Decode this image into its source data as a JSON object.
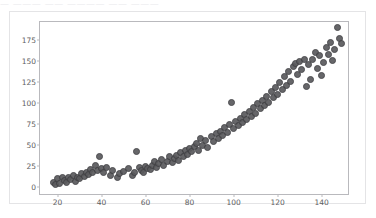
{
  "window": {
    "clipped_top_text": "—  ———  ——  ————  ——  ———"
  },
  "colors": {
    "marker_fill": "#5a5a5d",
    "marker_edge": "#3f3f42",
    "axis_line": "#b9b9bd",
    "tick_label": "#5e5e62",
    "card_border": "#e4e4e6",
    "background": "#ffffff"
  },
  "chart_data": {
    "type": "scatter",
    "title": "",
    "xlabel": "",
    "ylabel": "",
    "xlim": [
      12,
      152
    ],
    "ylim": [
      -8,
      196
    ],
    "grid": false,
    "legend": null,
    "xticks": [
      20,
      40,
      60,
      80,
      100,
      120,
      140
    ],
    "yticks": [
      0,
      25,
      50,
      75,
      100,
      125,
      150,
      175
    ],
    "xtick_labels": [
      "20",
      "40",
      "60",
      "80",
      "100",
      "120",
      "140"
    ],
    "ytick_labels": [
      "0",
      "25",
      "50",
      "75",
      "100",
      "125",
      "150",
      "175"
    ],
    "marker": "circle",
    "marker_size": 7,
    "series": [
      {
        "name": "series-1",
        "points": [
          [
            18,
            6
          ],
          [
            19,
            3
          ],
          [
            20,
            10
          ],
          [
            21,
            5
          ],
          [
            22,
            12
          ],
          [
            23,
            8
          ],
          [
            24,
            6
          ],
          [
            25,
            11
          ],
          [
            26,
            9
          ],
          [
            27,
            14
          ],
          [
            28,
            7
          ],
          [
            29,
            12
          ],
          [
            30,
            10
          ],
          [
            31,
            16
          ],
          [
            32,
            13
          ],
          [
            33,
            18
          ],
          [
            34,
            15
          ],
          [
            35,
            21
          ],
          [
            36,
            17
          ],
          [
            37,
            26
          ],
          [
            38,
            20
          ],
          [
            39,
            36
          ],
          [
            40,
            22
          ],
          [
            41,
            18
          ],
          [
            42,
            24
          ],
          [
            44,
            14
          ],
          [
            45,
            20
          ],
          [
            47,
            12
          ],
          [
            48,
            16
          ],
          [
            50,
            19
          ],
          [
            52,
            22
          ],
          [
            54,
            14
          ],
          [
            55,
            18
          ],
          [
            56,
            43
          ],
          [
            57,
            24
          ],
          [
            58,
            20
          ],
          [
            59,
            17
          ],
          [
            60,
            25
          ],
          [
            61,
            22
          ],
          [
            62,
            21
          ],
          [
            63,
            26
          ],
          [
            64,
            30
          ],
          [
            65,
            24
          ],
          [
            66,
            28
          ],
          [
            67,
            33
          ],
          [
            68,
            26
          ],
          [
            70,
            31
          ],
          [
            71,
            36
          ],
          [
            72,
            29
          ],
          [
            73,
            34
          ],
          [
            74,
            38
          ],
          [
            75,
            32
          ],
          [
            76,
            41
          ],
          [
            77,
            36
          ],
          [
            78,
            44
          ],
          [
            79,
            39
          ],
          [
            80,
            46
          ],
          [
            81,
            42
          ],
          [
            82,
            48
          ],
          [
            83,
            52
          ],
          [
            84,
            44
          ],
          [
            85,
            58
          ],
          [
            86,
            50
          ],
          [
            87,
            55
          ],
          [
            88,
            47
          ],
          [
            90,
            60
          ],
          [
            91,
            54
          ],
          [
            92,
            64
          ],
          [
            93,
            58
          ],
          [
            94,
            66
          ],
          [
            95,
            61
          ],
          [
            96,
            71
          ],
          [
            97,
            65
          ],
          [
            98,
            74
          ],
          [
            99,
            101
          ],
          [
            100,
            70
          ],
          [
            101,
            78
          ],
          [
            102,
            73
          ],
          [
            103,
            82
          ],
          [
            104,
            77
          ],
          [
            105,
            86
          ],
          [
            106,
            80
          ],
          [
            107,
            90
          ],
          [
            108,
            84
          ],
          [
            109,
            95
          ],
          [
            110,
            88
          ],
          [
            111,
            99
          ],
          [
            112,
            93
          ],
          [
            113,
            103
          ],
          [
            114,
            97
          ],
          [
            115,
            108
          ],
          [
            116,
            101
          ],
          [
            117,
            113
          ],
          [
            118,
            106
          ],
          [
            119,
            118
          ],
          [
            120,
            110
          ],
          [
            121,
            124
          ],
          [
            122,
            116
          ],
          [
            123,
            131
          ],
          [
            124,
            121
          ],
          [
            125,
            137
          ],
          [
            126,
            126
          ],
          [
            127,
            143
          ],
          [
            128,
            147
          ],
          [
            129,
            134
          ],
          [
            130,
            149
          ],
          [
            131,
            140
          ],
          [
            132,
            151
          ],
          [
            133,
            120
          ],
          [
            134,
            146
          ],
          [
            135,
            128
          ],
          [
            136,
            152
          ],
          [
            137,
            160
          ],
          [
            138,
            141
          ],
          [
            139,
            156
          ],
          [
            140,
            132
          ],
          [
            141,
            148
          ],
          [
            142,
            166
          ],
          [
            143,
            158
          ],
          [
            144,
            172
          ],
          [
            145,
            150
          ],
          [
            146,
            163
          ],
          [
            147,
            189
          ],
          [
            148,
            176
          ],
          [
            149,
            171
          ]
        ]
      }
    ]
  }
}
